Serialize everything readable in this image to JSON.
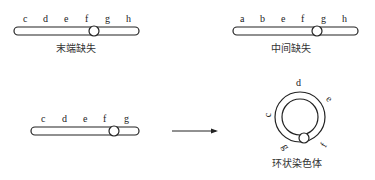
{
  "panels": [
    {
      "name": "terminal-deletion",
      "caption": "末端缺失",
      "genes": [
        "c",
        "d",
        "e",
        "f",
        "g",
        "h"
      ],
      "centromere_after": "f"
    },
    {
      "name": "interstitial-deletion",
      "caption": "中间缺失",
      "genes": [
        "a",
        "b",
        "e",
        "f",
        "g",
        "h"
      ],
      "centromere_after": "f"
    },
    {
      "name": "ring-source",
      "caption": "",
      "genes": [
        "c",
        "d",
        "e",
        "f",
        "g"
      ],
      "centromere_after": "f"
    },
    {
      "name": "ring-chromosome",
      "caption": "环状染色体",
      "genes": [
        "d",
        "e",
        "f",
        "g",
        "c"
      ]
    }
  ],
  "arrow": {
    "direction": "right"
  }
}
